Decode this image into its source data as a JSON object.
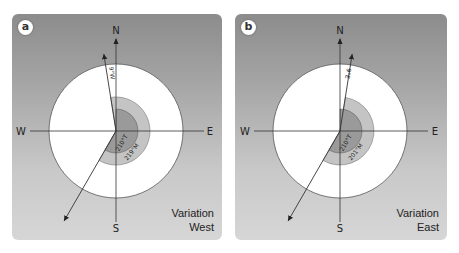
{
  "panels": [
    {
      "id": "a",
      "badge": "a",
      "caption_line1": "Variation",
      "caption_line2": "West",
      "directions": {
        "north": "N",
        "south": "S",
        "west": "W",
        "east": "E"
      },
      "variation_label": "9°W",
      "variation_degrees": -9,
      "true_bearing_label": "210°T",
      "true_bearing": 210,
      "magnetic_bearing_label": "219°M",
      "magnetic_bearing": 219
    },
    {
      "id": "b",
      "badge": "b",
      "caption_line1": "Variation",
      "caption_line2": "East",
      "directions": {
        "north": "N",
        "south": "S",
        "west": "W",
        "east": "E"
      },
      "variation_label": "9°E",
      "variation_degrees": 9,
      "true_bearing_label": "210°T",
      "true_bearing": 210,
      "magnetic_bearing_label": "201°M",
      "magnetic_bearing": 201
    }
  ],
  "colors": {
    "disc": "#ffffff",
    "inner_sector": "#9a9a9a",
    "outer_sector": "#c4c4c4",
    "line": "#333333"
  }
}
